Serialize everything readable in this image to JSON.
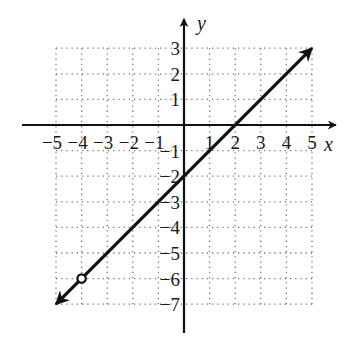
{
  "chart_data": {
    "type": "line",
    "title": "",
    "xlabel": "x",
    "ylabel": "y",
    "xlim": [
      -5,
      5
    ],
    "ylim": [
      -7,
      3
    ],
    "grid": true,
    "grid_style": "dotted",
    "x_ticks": [
      -5,
      -4,
      -3,
      -2,
      -1,
      1,
      2,
      3,
      4,
      5
    ],
    "y_ticks": [
      3,
      2,
      1,
      -1,
      -2,
      -3,
      -4,
      -5,
      -6,
      -7
    ],
    "x_tick_labels": [
      "−5",
      "−4",
      "−3",
      "−2",
      "−1",
      "1",
      "2",
      "3",
      "4",
      "5"
    ],
    "y_tick_labels": [
      "3",
      "2",
      "1",
      "−1",
      "−2",
      "−3",
      "−4",
      "−5",
      "−6",
      "−7"
    ],
    "series": [
      {
        "name": "y = x - 2",
        "equation": "y = x - 2",
        "slope": 1,
        "intercept": -2,
        "points": [
          [
            -5,
            -7
          ],
          [
            -4,
            -6
          ],
          [
            0,
            -2
          ],
          [
            2,
            0
          ],
          [
            5,
            3
          ]
        ],
        "arrow_ends": [
          [
            -5,
            -7
          ],
          [
            5,
            3
          ]
        ],
        "open_circle": [
          -4,
          -6
        ]
      }
    ]
  },
  "colors": {
    "line": "#111111",
    "grid": "#777777",
    "axis": "#111111",
    "background": "#ffffff"
  }
}
